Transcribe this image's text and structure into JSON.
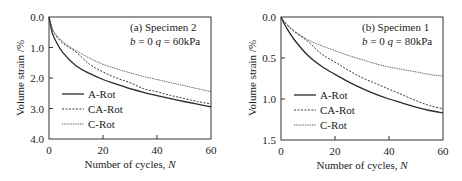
{
  "chart_data": [
    {
      "type": "line",
      "title": "(a) Specimen 2",
      "subtitle": "b = 0  q = 60kPa",
      "xlabel": "Number of cycles, N",
      "ylabel": "Volume strain /%",
      "xlim": [
        0,
        60
      ],
      "ylim": [
        0.0,
        4.0
      ],
      "y_inverted": true,
      "xticks": [
        "0",
        "20",
        "40",
        "60"
      ],
      "yticks": [
        "0.0",
        "1.0",
        "2.0",
        "3.0",
        "4.0"
      ],
      "grid": false,
      "legend_position": "lower-left",
      "x": [
        0,
        1,
        2,
        5,
        10,
        15,
        20,
        25,
        30,
        35,
        40,
        45,
        50,
        55,
        60
      ],
      "series": [
        {
          "name": "A-Rot",
          "style": "solid",
          "values": [
            0.0,
            0.45,
            0.7,
            1.15,
            1.6,
            1.85,
            2.05,
            2.2,
            2.35,
            2.47,
            2.58,
            2.68,
            2.77,
            2.86,
            2.95
          ]
        },
        {
          "name": "CA-Rot",
          "style": "dashed",
          "values": [
            0.0,
            0.35,
            0.55,
            0.85,
            1.15,
            1.55,
            1.8,
            2.0,
            2.15,
            2.35,
            2.45,
            2.57,
            2.67,
            2.77,
            2.85
          ]
        },
        {
          "name": "C-Rot",
          "style": "dotted",
          "values": [
            0.0,
            0.3,
            0.5,
            0.8,
            1.1,
            1.35,
            1.55,
            1.7,
            1.83,
            1.95,
            2.05,
            2.15,
            2.25,
            2.35,
            2.45
          ]
        }
      ]
    },
    {
      "type": "line",
      "title": "(b) Specimen 1",
      "subtitle": "b = 0  q = 80kPa",
      "xlabel": "Number of cycles, N",
      "ylabel": "Volume strain /%",
      "xlim": [
        0,
        60
      ],
      "ylim": [
        0.0,
        1.5
      ],
      "y_inverted": true,
      "xticks": [
        "0",
        "20",
        "40",
        "60"
      ],
      "yticks": [
        "0.0",
        "0.5",
        "1.0",
        "1.5"
      ],
      "grid": false,
      "legend_position": "lower-left",
      "x": [
        0,
        1,
        2,
        5,
        10,
        15,
        20,
        25,
        30,
        35,
        40,
        45,
        50,
        55,
        60
      ],
      "series": [
        {
          "name": "A-Rot",
          "style": "solid",
          "values": [
            0.0,
            0.07,
            0.13,
            0.28,
            0.47,
            0.6,
            0.7,
            0.79,
            0.87,
            0.94,
            1.0,
            1.05,
            1.1,
            1.14,
            1.17
          ]
        },
        {
          "name": "CA-Rot",
          "style": "dashed",
          "values": [
            0.0,
            0.05,
            0.09,
            0.18,
            0.3,
            0.45,
            0.55,
            0.65,
            0.74,
            0.81,
            0.88,
            0.95,
            1.02,
            1.08,
            1.12
          ]
        },
        {
          "name": "C-Rot",
          "style": "dotted",
          "values": [
            0.0,
            0.05,
            0.08,
            0.17,
            0.28,
            0.35,
            0.41,
            0.47,
            0.52,
            0.57,
            0.61,
            0.64,
            0.67,
            0.7,
            0.72
          ]
        }
      ]
    }
  ],
  "panels": [
    {
      "title": "(a) Specimen 2",
      "cond_b": "b",
      "cond_b_val": " = 0  ",
      "cond_q": "q",
      "cond_q_val": " = 60kPa",
      "ylabel": "Volume strain  /%",
      "xlabel_text": "Number of cycles,  ",
      "xlabel_var": "N",
      "yticks": [
        "0.0",
        "1.0",
        "2.0",
        "3.0",
        "4.0"
      ],
      "xticks": [
        "0",
        "20",
        "40",
        "60"
      ],
      "legend": [
        "A-Rot",
        "CA-Rot",
        "C-Rot"
      ]
    },
    {
      "title": "(b) Specimen 1",
      "cond_b": "b",
      "cond_b_val": " = 0  ",
      "cond_q": "q",
      "cond_q_val": " = 80kPa",
      "ylabel": "Volume strain  /%",
      "xlabel_text": "Number of cycles,  ",
      "xlabel_var": "N",
      "yticks": [
        "0.0",
        "0.5",
        "1.0",
        "1.5"
      ],
      "xticks": [
        "0",
        "20",
        "40",
        "60"
      ],
      "legend": [
        "A-Rot",
        "CA-Rot",
        "C-Rot"
      ]
    }
  ],
  "colors": {
    "axis": "#333333",
    "a_rot": "#2a2a2a",
    "ca_rot": "#3a3a3a",
    "c_rot": "#555555"
  }
}
